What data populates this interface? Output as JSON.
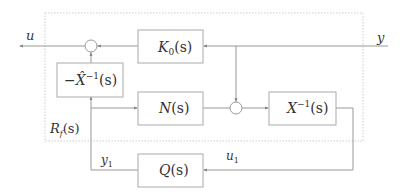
{
  "diagram": {
    "signals": {
      "u": "u",
      "y": "y",
      "y1": "y",
      "y1_sub": "1",
      "u1": "u",
      "u1_sub": "1",
      "rf": "R",
      "rf_sub": "f",
      "rf_arg": "(s)"
    },
    "blocks": {
      "k0": {
        "main": "K",
        "sub": "0",
        "arg": "(s)"
      },
      "xhat_inv": {
        "prefix": "−",
        "main": "X̂",
        "sup": "−1",
        "arg": "(s)"
      },
      "n": {
        "main": "N",
        "arg": "(s)"
      },
      "x_inv": {
        "main": "X",
        "sup": "−1",
        "arg": "(s)"
      },
      "q": {
        "main": "Q",
        "arg": "(s)"
      }
    }
  }
}
